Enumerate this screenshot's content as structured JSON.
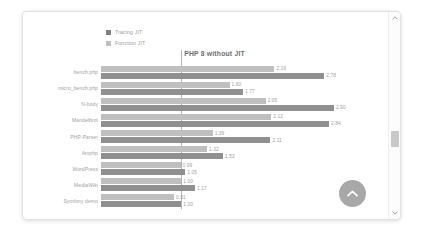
{
  "chart_data": {
    "type": "bar",
    "orientation": "horizontal",
    "title": "PHP 8 without JIT",
    "xlabel": "",
    "ylabel": "",
    "grid": false,
    "legend_position": "top-left",
    "reference_line": 1.0,
    "xlim": [
      0,
      3.1
    ],
    "categories": [
      "bench.php",
      "micro_bench.php",
      "N-body",
      "Mandelbrot",
      "PHP-Parser",
      "Amphp",
      "WordPress",
      "MediaWiki",
      "Symfony demo"
    ],
    "series": [
      {
        "name": "Function JIT",
        "color": "#bfbfbf",
        "values": [
          2.16,
          1.6,
          2.05,
          2.12,
          1.39,
          1.32,
          0.99,
          1.0,
          0.91
        ],
        "labels": [
          "2.16",
          "1.60",
          "2.05",
          "2.12",
          "1.39",
          "1.32",
          "0.99",
          "1.00",
          "0.91"
        ]
      },
      {
        "name": "Tracing JIT",
        "color": "#909090",
        "values": [
          2.78,
          1.77,
          2.9,
          2.84,
          2.11,
          1.52,
          1.05,
          1.17,
          1.0
        ],
        "labels": [
          "2.78",
          "1.77",
          "2.90",
          "2.84",
          "2.11",
          "1.52",
          "1.05",
          "1.17",
          "1.00"
        ]
      }
    ]
  },
  "legend": {
    "items": [
      {
        "label": "Tracing JIT",
        "swatch": "tracing"
      },
      {
        "label": "Function JIT",
        "swatch": "function"
      }
    ]
  },
  "controls": {
    "scroll_top_icon": "chevron-up-icon",
    "scrollbar_up_icon": "scrollbar-arrow-up-icon",
    "scrollbar_down_icon": "scrollbar-arrow-down-icon"
  },
  "colors": {
    "tracing_jit": "#909090",
    "function_jit": "#bfbfbf",
    "reference_line": "#b4b4b4",
    "fab_background": "#a8a8a8",
    "text": "#9d9d9d"
  }
}
